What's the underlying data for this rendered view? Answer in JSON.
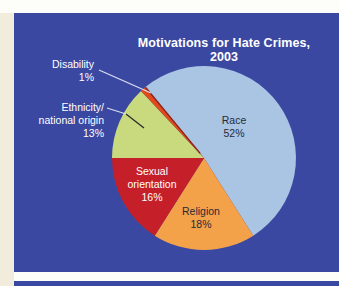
{
  "page": {
    "top_band_color": "#fdfdf9",
    "left_strip_color": "#f1ecdb",
    "gap_color": "#fefefe",
    "panel_color": "#3b48a1",
    "next_panel_color": "#3b48a1"
  },
  "chart_data": {
    "type": "pie",
    "title": "Motivations for Hate Crimes, 2003",
    "title_lines": [
      "Motivations for Hate Crimes,",
      "2003"
    ],
    "unit": "%",
    "start_angle_deg": 129.6,
    "categories": [
      "Race",
      "Religion",
      "Sexual orientation",
      "Ethnicity/national origin",
      "Disability"
    ],
    "values": [
      52,
      18,
      16,
      13,
      1
    ],
    "slices": [
      {
        "name": "Race",
        "pct": 52,
        "color": "#aac4e4",
        "label_lines": [
          "Race",
          "52%"
        ],
        "label_color": "#262b36"
      },
      {
        "name": "Religion",
        "pct": 18,
        "color": "#f3a24a",
        "label_lines": [
          "Religion",
          "18%"
        ],
        "label_color": "#262b36"
      },
      {
        "name": "Sexual orientation",
        "pct": 16,
        "color": "#c5202a",
        "label_lines": [
          "Sexual",
          "orientation",
          "16%"
        ],
        "label_color": "#ffffff"
      },
      {
        "name": "Ethnicity/national origin",
        "pct": 13,
        "color": "#c9da7e",
        "label_lines": [
          "Ethnicity/",
          "national origin",
          "13%"
        ],
        "label_color": "#ffffff"
      },
      {
        "name": "Disability",
        "pct": 1,
        "color": "#e14a1d",
        "label_lines": [
          "Disability",
          "1%"
        ],
        "label_color": "#ffffff"
      }
    ],
    "geometry": {
      "cx": 204,
      "cy": 158,
      "r": 92
    },
    "leader_lines": [
      {
        "for": "Disability",
        "color": "#d6ddf1",
        "points": [
          [
            99,
            70
          ],
          [
            151,
            93
          ]
        ]
      },
      {
        "for": "Ethnicity/national origin",
        "color": "#d6ddf1",
        "points": [
          [
            107,
            108
          ],
          [
            126,
            114
          ]
        ]
      },
      {
        "for": "Ethnicity/national origin",
        "color": "#2b2b2b",
        "points": [
          [
            126,
            114
          ],
          [
            144,
            128
          ]
        ]
      }
    ],
    "accent_edge": {
      "color": "#8e2418",
      "angle_deg": 129.6
    }
  }
}
